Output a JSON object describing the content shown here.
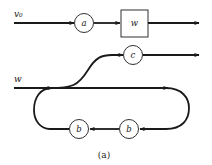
{
  "diagram": {
    "top_row": {
      "input_label": "v₀",
      "node_a": "a",
      "box_w": "w"
    },
    "branch": {
      "node_c": "c"
    },
    "main_line": {
      "input_label": "w"
    },
    "loop": {
      "node_b_left": "b",
      "node_b_right": "b"
    },
    "caption": "(a)",
    "colors": {
      "stroke": "#1a1a1a",
      "background": "#ffffff"
    }
  }
}
